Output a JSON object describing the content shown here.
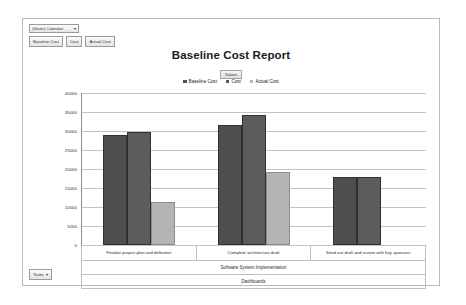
{
  "toolbar": {
    "dropdown_value": "(Static) Calendar",
    "dropdown_arrow": "▾",
    "buttons": [
      {
        "label": "Baseline Cost"
      },
      {
        "label": "Cost"
      },
      {
        "label": "Actual Cost"
      }
    ]
  },
  "footer": {
    "label": "Tasks",
    "arrow": "▾"
  },
  "chart_data": {
    "type": "bar",
    "title": "Baseline Cost Report",
    "values_tag": "Values",
    "xlabel": "",
    "ylabel": "Cost",
    "ylim": [
      0,
      40000
    ],
    "yticks": [
      40000,
      35000,
      30000,
      25000,
      20000,
      15000,
      10000,
      5000,
      0
    ],
    "ytick_labels": [
      "40000",
      "35000",
      "30000",
      "25000",
      "20000",
      "15000",
      "10000",
      "5000",
      "0"
    ],
    "grid": true,
    "legend_position": "top-center",
    "categories": [
      "Finalize project plan and definition",
      "Complete architecture draft",
      "Send out draft and review with key sponsors"
    ],
    "group_labels": {
      "level2": "Software System Implementation",
      "level3": "Dashboards"
    },
    "series": [
      {
        "name": "Baseline Cost",
        "color": "#4f4f4f",
        "values": [
          29000,
          31700,
          17800
        ]
      },
      {
        "name": "Cost",
        "color": "#5c5c5c",
        "values": [
          29800,
          34200,
          17800
        ]
      },
      {
        "name": "Actual Cost",
        "color": "#b4b4b4",
        "values": [
          11200,
          19200,
          null
        ]
      }
    ]
  }
}
